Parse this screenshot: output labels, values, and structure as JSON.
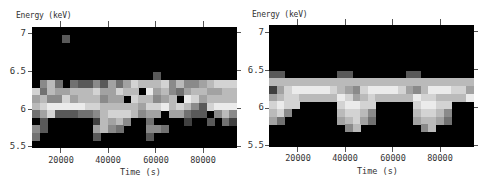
{
  "chart_data": [
    {
      "type": "heatmap",
      "title": "",
      "xlabel": "Time (s)",
      "ylabel": "Energy (keV)",
      "xlim": [
        8000,
        95000
      ],
      "ylim": [
        5.5,
        7.1
      ],
      "xticks": [
        20000,
        40000,
        60000,
        80000
      ],
      "xtick_labels": [
        "20000",
        "40000",
        "60000",
        "80000"
      ],
      "yticks": [
        5.5,
        6,
        6.5,
        7
      ],
      "ytick_labels": [
        "5.5",
        "6",
        "6.5",
        "7"
      ],
      "colormap": "grayscale (black = low, white = high)",
      "grid": false,
      "description": "Observed energy-time map: bright band between ~6.0 and ~6.55 keV with irregular low-energy extensions",
      "ncols": 27,
      "nrows": 16,
      "rows_top_to_bottom": [
        "000000000000000000000000000",
        "000020000000000000000000000",
        "000000000000000000000000000",
        "000000000000000000000000000",
        "000000000000000000000000000",
        "000000000000000000000000000",
        "000000000000000020000000000",
        "046303224253576667464456777",
        "736556667557660856435665566",
        "564475666455076645608756666",
        "678888877666665778676427888",
        "357222334677764550553220464",
        "020000001656400300001002031",
        "420000005643000443000000000",
        "300000002000000200000000000",
        "000000000000000000000000000"
      ]
    },
    {
      "type": "heatmap",
      "title": "",
      "xlabel": "Time (s)",
      "ylabel": "Energy (keV)",
      "xlim": [
        8000,
        95000
      ],
      "ylim": [
        5.5,
        7.1
      ],
      "xticks": [
        20000,
        40000,
        60000,
        80000
      ],
      "xtick_labels": [
        "20000",
        "40000",
        "60000",
        "80000"
      ],
      "yticks": [
        5.5,
        6,
        6.5,
        7
      ],
      "ytick_labels": [
        "5.5",
        "6",
        "6.5",
        "7"
      ],
      "colormap": "grayscale (black = low, white = high)",
      "grid": false,
      "description": "Model energy-time map: periodic bright band between ~6.0 and ~6.5 keV with repeating downward extensions every ~19000 s",
      "ncols": 27,
      "nrows": 16,
      "rows_top_to_bottom": [
        "000000000000000000000000000",
        "000000000000000000000000000",
        "000000000000000000000000000",
        "000000000000000000000000000",
        "000000000000000000000000000",
        "000000000000000000000000000",
        "220000000220000000220000000",
        "666666666666666666666666666",
        "157888887654788887546888775",
        "567766666875676666687766668",
        "787700000788770000078877000",
        "674000000677640000067764000",
        "530000000567530000056653000",
        "000000000046000000004600000",
        "000000000000000000000000000",
        "000000000000000000000000000"
      ]
    }
  ],
  "panels": [
    {
      "ylabel": "Energy (keV)",
      "xlabel": "Time (s)",
      "ytick_labels": [
        "7",
        "6.5",
        "6",
        "5.5"
      ],
      "xtick_labels": [
        "20000",
        "40000",
        "60000",
        "80000"
      ]
    },
    {
      "ylabel": "Energy (keV)",
      "xlabel": "Time (s)",
      "ytick_labels": [
        "7",
        "6.5",
        "6",
        "5.5"
      ],
      "xtick_labels": [
        "20000",
        "40000",
        "60000",
        "80000"
      ]
    }
  ]
}
